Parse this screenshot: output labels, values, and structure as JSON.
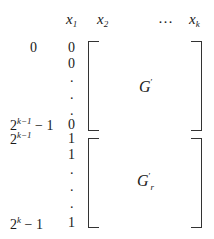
{
  "header": {
    "col1": {
      "var": "x",
      "sub": "1"
    },
    "col2": {
      "var": "x",
      "sub": "2"
    },
    "ellipsis": "…",
    "colk": {
      "var": "x",
      "sub": "k"
    }
  },
  "row_labels": {
    "top": "0",
    "upper_end": {
      "base": "2",
      "exp": "k−1",
      "suffix": " − 1"
    },
    "lower_start": {
      "base": "2",
      "exp": "k−1"
    },
    "lower_end": {
      "base": "2",
      "exp": "k",
      "suffix": " − 1"
    }
  },
  "first_column": {
    "upper": [
      "0",
      "0",
      ".",
      ".",
      ".",
      "0"
    ],
    "lower": [
      "1",
      "1",
      ".",
      ".",
      ".",
      "1"
    ]
  },
  "blocks": {
    "upper": {
      "name": "G",
      "prime": "′",
      "sub": ""
    },
    "lower": {
      "name": "G",
      "prime": "′",
      "sub": "r"
    }
  }
}
